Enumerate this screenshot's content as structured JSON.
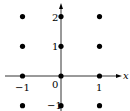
{
  "chart_data": {
    "type": "scatter",
    "title": "",
    "xlabel": "x",
    "ylabel": "",
    "xlim": [
      -1.4,
      1.6
    ],
    "ylim": [
      -1.15,
      2.4
    ],
    "grid": false,
    "points": [
      {
        "x": -1,
        "y": 2
      },
      {
        "x": 0,
        "y": 2
      },
      {
        "x": 1,
        "y": 2
      },
      {
        "x": -1,
        "y": 1
      },
      {
        "x": 0,
        "y": 1
      },
      {
        "x": 1,
        "y": 1
      },
      {
        "x": -1,
        "y": 0
      },
      {
        "x": 0,
        "y": 0
      },
      {
        "x": 1,
        "y": 0
      },
      {
        "x": -1,
        "y": -1
      },
      {
        "x": 0,
        "y": -1
      },
      {
        "x": 1,
        "y": -1
      }
    ],
    "x_ticks": [
      "-1",
      "0",
      "1"
    ],
    "y_ticks": [
      "-1",
      "1",
      "2"
    ]
  },
  "labels": {
    "x_axis": "x",
    "origin": "0",
    "x_neg1": "−1",
    "x_pos1": "1",
    "y_neg1": "−1",
    "y_pos1": "1",
    "y_pos2": "2"
  }
}
